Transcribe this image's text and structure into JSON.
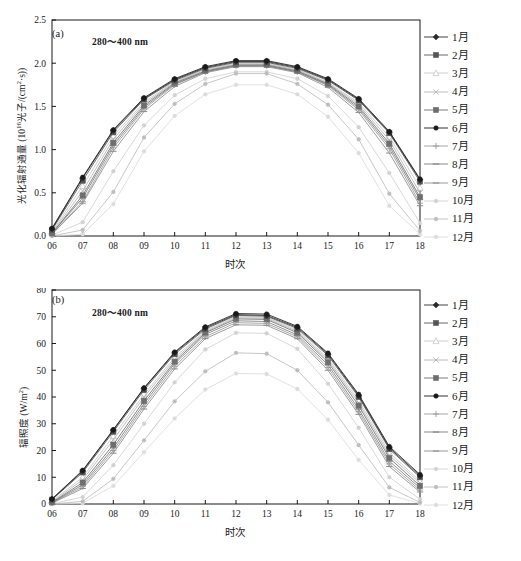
{
  "figure": {
    "width": 521,
    "height": 561,
    "background": "#ffffff"
  },
  "legend": {
    "position": "right",
    "items": [
      {
        "label": "1月",
        "color": "#2b2b2b",
        "marker": "diamond-filled"
      },
      {
        "label": "2月",
        "color": "#555555",
        "marker": "square-filled"
      },
      {
        "label": "3月",
        "color": "#c8c8c8",
        "marker": "triangle-open"
      },
      {
        "label": "4月",
        "color": "#b4b4b4",
        "marker": "cross"
      },
      {
        "label": "5月",
        "color": "#6e6e6e",
        "marker": "square-filled"
      },
      {
        "label": "6月",
        "color": "#1a1a1a",
        "marker": "circle-filled"
      },
      {
        "label": "7月",
        "color": "#9a9a9a",
        "marker": "plus"
      },
      {
        "label": "8月",
        "color": "#7d7d7d",
        "marker": "line"
      },
      {
        "label": "9月",
        "color": "#8c8c8c",
        "marker": "line"
      },
      {
        "label": "10月",
        "color": "#d2d2d2",
        "marker": "dot"
      },
      {
        "label": "11月",
        "color": "#bdbdbd",
        "marker": "dot"
      },
      {
        "label": "12月",
        "color": "#dcdcdc",
        "marker": "dot"
      }
    ]
  },
  "chart_data": [
    {
      "id": "panel-a",
      "type": "line",
      "panel_label": "(a)",
      "annotation": "280～400 nm",
      "title": "",
      "xlabel": "时次",
      "ylabel": "光化辐射通量 (10¹⁶光子/(cm²·s))",
      "ylabel_parts": {
        "main": "光化辐射通量 (10",
        "sup": "16",
        "tail": "光子/(cm",
        "sup2": "2",
        "tail2": "·s))"
      },
      "x": [
        "06",
        "07",
        "08",
        "09",
        "10",
        "11",
        "12",
        "13",
        "14",
        "15",
        "16",
        "17",
        "18"
      ],
      "xlim": [
        6,
        18
      ],
      "ylim": [
        0.0,
        2.5
      ],
      "yticks": [
        "0.0",
        "0.5",
        "1.0",
        "1.5",
        "2.0",
        "2.5"
      ],
      "grid": false,
      "series": [
        {
          "name": "1月",
          "values": [
            0.08,
            0.67,
            1.22,
            1.59,
            1.81,
            1.95,
            2.02,
            2.02,
            1.95,
            1.81,
            1.58,
            1.2,
            0.65
          ]
        },
        {
          "name": "2月",
          "values": [
            0.07,
            0.64,
            1.2,
            1.58,
            1.8,
            1.94,
            2.01,
            2.01,
            1.94,
            1.8,
            1.57,
            1.19,
            0.63
          ]
        },
        {
          "name": "3月",
          "values": [
            0.05,
            0.58,
            1.16,
            1.55,
            1.79,
            1.93,
            2.0,
            2.0,
            1.93,
            1.78,
            1.54,
            1.15,
            0.56
          ]
        },
        {
          "name": "4月",
          "values": [
            0.04,
            0.52,
            1.12,
            1.53,
            1.78,
            1.92,
            1.99,
            1.99,
            1.92,
            1.77,
            1.52,
            1.11,
            0.5
          ]
        },
        {
          "name": "5月",
          "values": [
            0.03,
            0.47,
            1.08,
            1.51,
            1.77,
            1.91,
            1.98,
            1.98,
            1.91,
            1.76,
            1.5,
            1.07,
            0.45
          ]
        },
        {
          "name": "6月",
          "values": [
            0.09,
            0.68,
            1.23,
            1.6,
            1.82,
            1.96,
            2.03,
            2.03,
            1.96,
            1.82,
            1.59,
            1.21,
            0.66
          ]
        },
        {
          "name": "7月",
          "values": [
            0.02,
            0.4,
            1.02,
            1.47,
            1.75,
            1.9,
            1.97,
            1.97,
            1.9,
            1.74,
            1.46,
            1.01,
            0.38
          ]
        },
        {
          "name": "8月",
          "values": [
            0.03,
            0.44,
            1.05,
            1.49,
            1.76,
            1.9,
            1.97,
            1.97,
            1.9,
            1.75,
            1.48,
            1.04,
            0.42
          ]
        },
        {
          "name": "9月",
          "values": [
            0.02,
            0.38,
            0.98,
            1.44,
            1.73,
            1.89,
            1.96,
            1.96,
            1.89,
            1.72,
            1.43,
            0.96,
            0.35
          ]
        },
        {
          "name": "10月",
          "values": [
            0.01,
            0.16,
            0.75,
            1.28,
            1.63,
            1.82,
            1.9,
            1.9,
            1.82,
            1.62,
            1.26,
            0.73,
            0.15
          ]
        },
        {
          "name": "11月",
          "values": [
            0.0,
            0.07,
            0.51,
            1.14,
            1.53,
            1.76,
            1.88,
            1.88,
            1.76,
            1.52,
            1.12,
            0.49,
            0.06
          ]
        },
        {
          "name": "12月",
          "values": [
            0.0,
            0.02,
            0.37,
            0.98,
            1.39,
            1.64,
            1.75,
            1.75,
            1.64,
            1.38,
            0.96,
            0.35,
            0.02
          ]
        }
      ]
    },
    {
      "id": "panel-b",
      "type": "line",
      "panel_label": "(b)",
      "annotation": "280～400 nm",
      "title": "",
      "xlabel": "时次",
      "ylabel": "辐照度 (W/m²)",
      "ylabel_parts": {
        "main": "辐照度 (W/m",
        "sup": "2",
        "tail": ")"
      },
      "x": [
        "06",
        "07",
        "08",
        "09",
        "10",
        "11",
        "12",
        "13",
        "14",
        "15",
        "16",
        "17",
        "18"
      ],
      "xlim": [
        6,
        18
      ],
      "ylim": [
        0,
        80
      ],
      "yticks": [
        "0",
        "10",
        "20",
        "30",
        "40",
        "50",
        "60",
        "70",
        "80"
      ],
      "grid": false,
      "series": [
        {
          "name": "1月",
          "values": [
            1.8,
            12.3,
            27.6,
            43.2,
            56.5,
            65.8,
            70.8,
            70.5,
            66.0,
            56.0,
            40.5,
            21.0,
            10.5
          ]
        },
        {
          "name": "2月",
          "values": [
            1.6,
            11.8,
            27.0,
            42.6,
            56.0,
            65.4,
            70.5,
            70.2,
            65.6,
            55.5,
            40.0,
            20.5,
            10.0
          ]
        },
        {
          "name": "3月",
          "values": [
            1.0,
            10.0,
            25.4,
            41.0,
            54.8,
            64.8,
            70.0,
            69.8,
            65.0,
            54.5,
            38.8,
            19.2,
            8.6
          ]
        },
        {
          "name": "4月",
          "values": [
            0.8,
            9.0,
            24.0,
            40.0,
            54.0,
            64.4,
            69.6,
            69.4,
            64.5,
            53.8,
            37.8,
            18.2,
            7.8
          ]
        },
        {
          "name": "5月",
          "values": [
            0.6,
            8.0,
            22.2,
            38.6,
            53.2,
            64.0,
            69.2,
            69.0,
            64.0,
            53.0,
            36.8,
            17.2,
            6.8
          ]
        },
        {
          "name": "6月",
          "values": [
            1.9,
            12.6,
            27.8,
            43.4,
            56.8,
            66.2,
            71.2,
            71.0,
            66.4,
            56.4,
            41.0,
            21.5,
            11.0
          ]
        },
        {
          "name": "7月",
          "values": [
            0.4,
            6.5,
            20.0,
            36.5,
            51.5,
            62.5,
            67.8,
            67.5,
            62.5,
            51.0,
            34.5,
            15.0,
            5.2
          ]
        },
        {
          "name": "8月",
          "values": [
            0.5,
            7.2,
            21.0,
            37.5,
            52.5,
            63.4,
            68.5,
            68.2,
            63.2,
            52.0,
            35.5,
            16.0,
            6.0
          ]
        },
        {
          "name": "9月",
          "values": [
            0.3,
            5.8,
            19.0,
            35.5,
            50.5,
            61.8,
            67.0,
            66.8,
            61.8,
            50.0,
            33.5,
            14.0,
            4.5
          ]
        },
        {
          "name": "10月",
          "values": [
            0.1,
            2.6,
            14.5,
            30.0,
            45.5,
            57.8,
            64.0,
            63.8,
            58.0,
            45.0,
            28.5,
            10.0,
            1.8
          ]
        },
        {
          "name": "11月",
          "values": [
            0.0,
            1.0,
            9.4,
            23.8,
            38.4,
            49.6,
            56.5,
            56.2,
            50.0,
            38.0,
            22.0,
            6.2,
            0.6
          ]
        },
        {
          "name": "12月",
          "values": [
            0.0,
            0.3,
            6.8,
            19.4,
            32.0,
            42.8,
            48.8,
            48.6,
            43.0,
            31.5,
            16.5,
            3.4,
            0.2
          ]
        }
      ]
    }
  ]
}
